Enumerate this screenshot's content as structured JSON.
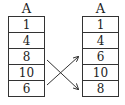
{
  "diagram": {
    "left_array": {
      "label": "A",
      "values": [
        "1",
        "4",
        "8",
        "10",
        "6"
      ]
    },
    "right_array": {
      "label": "A",
      "values": [
        "1",
        "4",
        "6",
        "10",
        "8"
      ]
    },
    "swap": {
      "from_index": 2,
      "to_index": 4,
      "description": "swap arrows between positions 3 and 5"
    }
  }
}
